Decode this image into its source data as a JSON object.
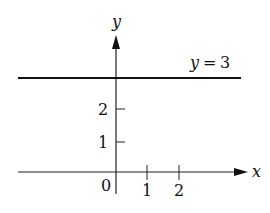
{
  "diagram": {
    "axes": {
      "x_label": "x",
      "y_label": "y",
      "origin_label": "0",
      "x_ticks": [
        "1",
        "2"
      ],
      "y_ticks": [
        "1",
        "2"
      ]
    },
    "line": {
      "label": "y = 3",
      "label_var": "y",
      "label_eq": "=",
      "label_val": "3",
      "equation": "y = 3",
      "y_value": 3
    },
    "colors": {
      "stroke": "#111111",
      "background": "#ffffff"
    }
  }
}
